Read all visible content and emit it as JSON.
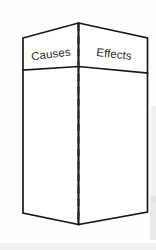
{
  "diagram": {
    "type": "folded-two-panel-card",
    "background_color": "#fefefe",
    "outline_color": "#1a1a1a",
    "text_color": "#2a2a2a",
    "panels": [
      {
        "id": "left-panel",
        "label": "Causes",
        "side": "left",
        "label_rotation_deg": -7
      },
      {
        "id": "right-panel",
        "label": "Effects",
        "side": "right",
        "label_rotation_deg": 6
      }
    ],
    "center_fold": {
      "name": "center-crease",
      "style": "dashed",
      "dash_length": 7,
      "gap_length": 5.5
    },
    "header_divider": {
      "name": "header-divider",
      "style": "solid"
    },
    "geometry": {
      "top_left": [
        23,
        38
      ],
      "top_apex": [
        78.5,
        23
      ],
      "top_right": [
        147.5,
        38
      ],
      "divider_left": [
        23,
        70
      ],
      "divider_center": [
        78.5,
        66.5
      ],
      "divider_right": [
        147.5,
        73
      ],
      "bottom_left": [
        23,
        213
      ],
      "bottom_vertex": [
        78.5,
        224.5
      ],
      "bottom_right": [
        147.5,
        212
      ],
      "crease_top": [
        78.5,
        24
      ],
      "crease_bottom": [
        78.5,
        224
      ]
    }
  }
}
